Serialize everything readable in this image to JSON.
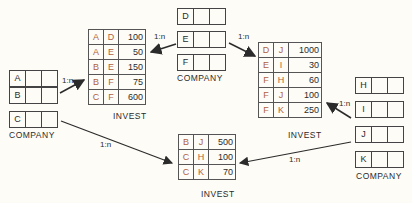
{
  "company_left": {
    "label": "COMPANY",
    "rows": [
      "A",
      "B",
      "C"
    ]
  },
  "company_top": {
    "label": "COMPANY",
    "rows": [
      "D",
      "E",
      "F"
    ]
  },
  "company_right": {
    "label": "COMPANY",
    "rows": [
      "H",
      "I",
      "J",
      "K"
    ]
  },
  "invest_left": {
    "label": "INVEST",
    "rows": [
      [
        "A",
        "D",
        "100"
      ],
      [
        "A",
        "E",
        "50"
      ],
      [
        "B",
        "E",
        "150"
      ],
      [
        "B",
        "F",
        "75"
      ],
      [
        "C",
        "F",
        "600"
      ]
    ]
  },
  "invest_right": {
    "label": "INVEST",
    "rows": [
      [
        "D",
        "J",
        "1000"
      ],
      [
        "E",
        "I",
        "30"
      ],
      [
        "F",
        "H",
        "60"
      ],
      [
        "F",
        "J",
        "100"
      ],
      [
        "F",
        "K",
        "250"
      ]
    ]
  },
  "invest_bottom": {
    "label": "INVEST",
    "rows": [
      [
        "B",
        "J",
        "500"
      ],
      [
        "C",
        "H",
        "100"
      ],
      [
        "C",
        "K",
        "70"
      ]
    ]
  },
  "cardinality": "1:n",
  "colors": {
    "key": "#b0623b",
    "line": "#2b2b2b",
    "background": "#fdfcf7"
  }
}
